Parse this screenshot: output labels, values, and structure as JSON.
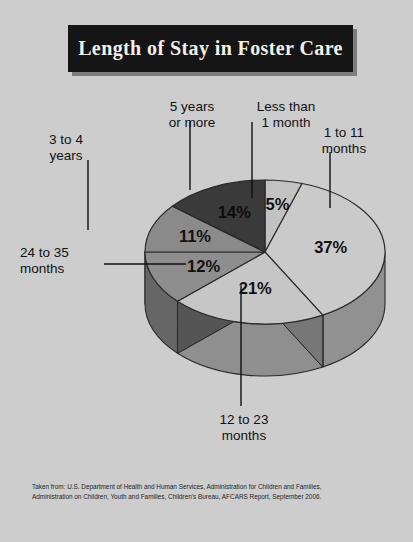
{
  "title": {
    "text": "Length of Stay in Foster Care"
  },
  "labels": {
    "less_than_1_month": "Less than\n1 month",
    "one_to_11_months": "1 to 11\nmonths",
    "twelve_to_23_months": "12 to 23\nmonths",
    "twentyfour_to_35_months": "24 to 35\nmonths",
    "three_to_4_years": "3 to 4\nyears",
    "five_years_or_more": "5 years\nor more"
  },
  "percent_labels": {
    "less_than_1_month": "5%",
    "one_to_11_months": "37%",
    "twelve_to_23_months": "21%",
    "twentyfour_to_35_months": "12%",
    "three_to_4_years": "11%",
    "five_years_or_more": "14%"
  },
  "footnote": {
    "line1": "Taken from: U.S. Department of Health and Human Services, Administration for Children and Families,",
    "line2": "Administration on Children, Youth and Families, Children's Bureau, AFCARS Report, September 2006."
  },
  "colors": {
    "background": "#cdcdcd",
    "title_box": "#151515",
    "title_text": "#f2f0ec",
    "slice_less_than_1_month": "#c2c2c2",
    "slice_1_to_11_months": "#cacaca",
    "slice_12_to_23_months": "#c6c6c6",
    "slice_24_to_35_months": "#8e8e8e",
    "slice_3_to_4_years": "#8a8a8a",
    "slice_5_years_or_more": "#3a3a3a",
    "outline": "#2a2a2a",
    "leader_line": "#111111"
  },
  "chart_data": {
    "type": "pie",
    "title": "Length of Stay in Foster Care",
    "xlabel": "",
    "ylabel": "",
    "legend_position": "callout-labels",
    "grid": false,
    "units": "percent",
    "total": 100,
    "categories": [
      "Less than 1 month",
      "1 to 11 months",
      "12 to 23 months",
      "24 to 35 months",
      "3 to 4 years",
      "5 years or more"
    ],
    "values": [
      5,
      37,
      21,
      12,
      11,
      14
    ],
    "slices": [
      {
        "label": "Less than 1 month",
        "value": 5,
        "display": "5%",
        "color": "#c2c2c2"
      },
      {
        "label": "1 to 11 months",
        "value": 37,
        "display": "37%",
        "color": "#cacaca"
      },
      {
        "label": "12 to 23 months",
        "value": 21,
        "display": "21%",
        "color": "#c6c6c6"
      },
      {
        "label": "24 to 35 months",
        "value": 12,
        "display": "12%",
        "color": "#8e8e8e"
      },
      {
        "label": "3 to 4 years",
        "value": 11,
        "display": "11%",
        "color": "#8a8a8a"
      },
      {
        "label": "5 years or more",
        "value": 14,
        "display": "14%",
        "color": "#3a3a3a"
      }
    ],
    "source": "Taken from: U.S. Department of Health and Human Services, Administration for Children and Families, Administration on Children, Youth and Families, Children's Bureau, AFCARS Report, September 2006."
  }
}
